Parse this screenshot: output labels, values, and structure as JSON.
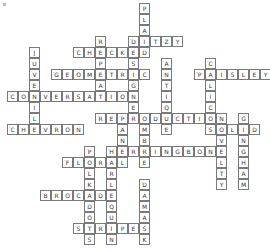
{
  "puzzle": {
    "type": "crossword",
    "cell_size": 11,
    "origin": {
      "x": 7,
      "y": 3
    },
    "words": [
      {
        "word": "PLAID",
        "col": 12,
        "row": 0,
        "dir": "down",
        "numbered": true
      },
      {
        "word": "DITZY",
        "col": 11,
        "row": 3,
        "dir": "across",
        "numbered": true
      },
      {
        "word": "REPEAT",
        "col": 8,
        "row": 3,
        "dir": "down",
        "numbered": true
      },
      {
        "word": "DESIGNER",
        "col": 11,
        "row": 3,
        "dir": "down",
        "numbered": false
      },
      {
        "word": "CHECKED",
        "col": 6,
        "row": 4,
        "dir": "across",
        "numbered": true
      },
      {
        "word": "JUVENILE",
        "col": 2,
        "row": 4,
        "dir": "down",
        "numbered": true
      },
      {
        "word": "GEOMETRIC",
        "col": 4,
        "row": 6,
        "dir": "across",
        "numbered": true
      },
      {
        "word": "ANTIQUE",
        "col": 14,
        "row": 5,
        "dir": "down",
        "numbered": true
      },
      {
        "word": "CALICO",
        "col": 18,
        "row": 5,
        "dir": "down",
        "numbered": true
      },
      {
        "word": "PAISLEY",
        "col": 17,
        "row": 6,
        "dir": "across",
        "numbered": true
      },
      {
        "word": "CONVERSATION",
        "col": 0,
        "row": 8,
        "dir": "across",
        "numbered": true
      },
      {
        "word": "CHEVRON",
        "col": 0,
        "row": 11,
        "dir": "across",
        "numbered": true
      },
      {
        "word": "REPRODUCTION",
        "col": 8,
        "row": 10,
        "dir": "across",
        "numbered": true
      },
      {
        "word": "PANEL",
        "col": 10,
        "row": 10,
        "dir": "down",
        "numbered": true
      },
      {
        "word": "OMBRE",
        "col": 12,
        "row": 10,
        "dir": "down",
        "numbered": false
      },
      {
        "word": "NOVELTY",
        "col": 19,
        "row": 10,
        "dir": "down",
        "numbered": true
      },
      {
        "word": "GINGHAM",
        "col": 21,
        "row": 10,
        "dir": "down",
        "numbered": true
      },
      {
        "word": "SOLID",
        "col": 18,
        "row": 11,
        "dir": "across",
        "numbered": true
      },
      {
        "word": "HERRINGBONE",
        "col": 9,
        "row": 13,
        "dir": "across",
        "numbered": true
      },
      {
        "word": "POLKADOTS",
        "col": 7,
        "row": 13,
        "dir": "down",
        "numbered": true
      },
      {
        "word": "HARLEQUIN",
        "col": 9,
        "row": 13,
        "dir": "down",
        "numbered": false
      },
      {
        "word": "FLORAL",
        "col": 5,
        "row": 14,
        "dir": "across",
        "numbered": true
      },
      {
        "word": "DAMASK",
        "col": 12,
        "row": 16,
        "dir": "down",
        "numbered": true
      },
      {
        "word": "BROCADE",
        "col": 3,
        "row": 17,
        "dir": "across",
        "numbered": true
      },
      {
        "word": "STRIPES",
        "col": 6,
        "row": 20,
        "dir": "across",
        "numbered": true
      }
    ],
    "colors": {
      "border": "#7a7a7a",
      "text": "#333333",
      "background": "#ffffff"
    }
  }
}
